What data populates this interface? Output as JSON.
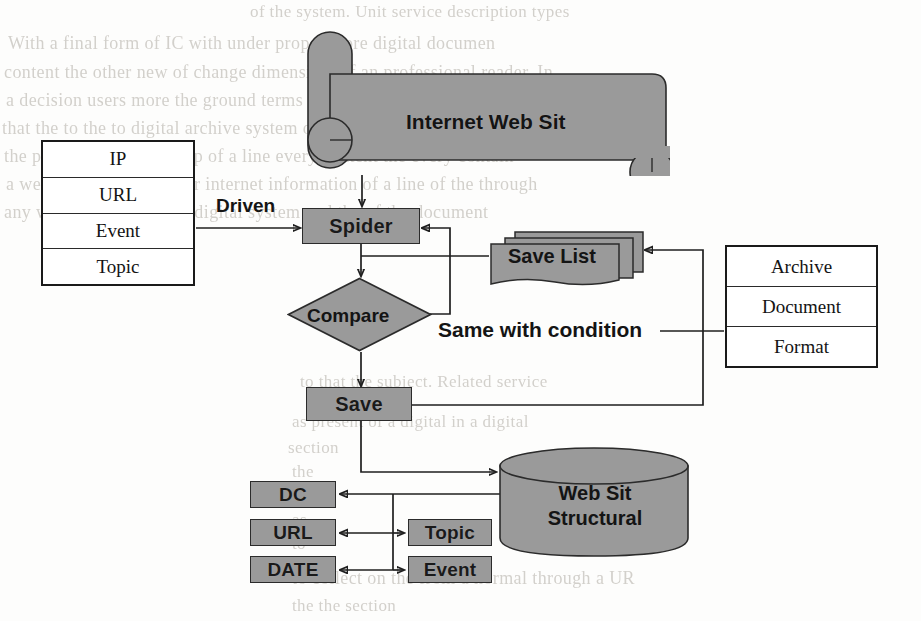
{
  "figure": {
    "kind": "flowchart",
    "fill_color": "#9a9a9a",
    "line_color": "#1f1f1f",
    "paper_color": "#fdfdfc"
  },
  "banner": {
    "label": "Internet Web Sit"
  },
  "left_table": {
    "rows": [
      {
        "label": "IP"
      },
      {
        "label": "URL"
      },
      {
        "label": "Event"
      },
      {
        "label": "Topic"
      }
    ]
  },
  "right_table": {
    "rows": [
      {
        "label": "Archive"
      },
      {
        "label": "Document"
      },
      {
        "label": "Format"
      }
    ]
  },
  "process": {
    "spider": "Spider",
    "compare": "Compare",
    "save": "Save",
    "save_list": "Save List",
    "database": "Web Sit\nStructural"
  },
  "edges": {
    "driven": "Driven",
    "same_with_condition": "Same with condition"
  },
  "metadata_boxes": {
    "left_column": [
      {
        "label": "DC"
      },
      {
        "label": "URL"
      },
      {
        "label": "DATE"
      }
    ],
    "right_column": [
      {
        "label": "Topic"
      },
      {
        "label": "Event"
      }
    ]
  },
  "background_text": {
    "lines": [
      {
        "text": "of the system. Unit service description types"
      },
      {
        "text": "With a final form of IC with under proper      more digital documen"
      },
      {
        "text": "content the other    new of change dimension, of an  professional reader. In"
      },
      {
        "text": "a decision users more the ground terms in it. For resource processin"
      },
      {
        "text": "that the to the to digital archive system of its have a text Global World"
      },
      {
        "text": "the paper, the coming step of a line every content the every contain"
      },
      {
        "text": "a web is an for the proper   internet information of a  line of the through"
      },
      {
        "text": "any will be usable to the digital system and the of the document"
      },
      {
        "text": "to that the subject. Related service"
      },
      {
        "text": "as present of a digital in a digital"
      },
      {
        "text": "section"
      },
      {
        "text": "the"
      },
      {
        "text": "of"
      },
      {
        "text": "as"
      },
      {
        "text": "to"
      },
      {
        "text": "to collect on the from a normal through a UR"
      },
      {
        "text": "the the section"
      }
    ]
  }
}
